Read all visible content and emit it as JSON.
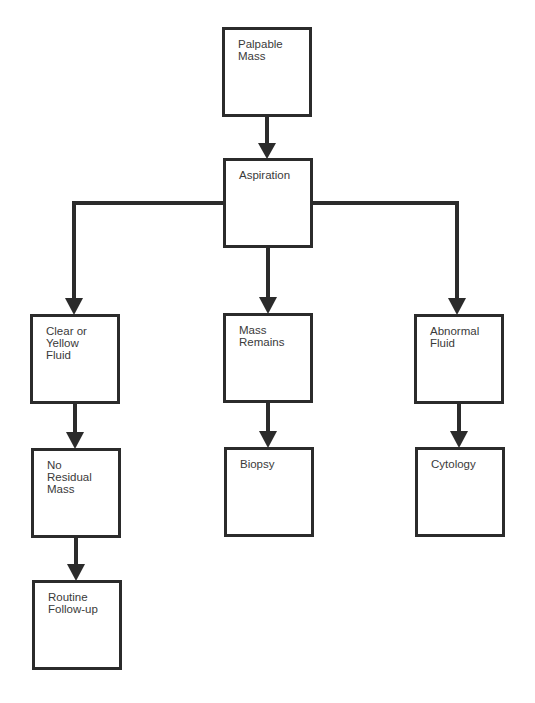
{
  "diagram": {
    "type": "flowchart",
    "colors": {
      "line": "#2b2b2b",
      "text": "#3a3a3a",
      "background": "#ffffff"
    },
    "nodes": [
      {
        "id": "palpable-mass",
        "label": "Palpable\nMass",
        "x": 222,
        "y": 27
      },
      {
        "id": "aspiration",
        "label": "Aspiration",
        "x": 223,
        "y": 158
      },
      {
        "id": "clear-yellow-fluid",
        "label": "Clear or\nYellow\nFluid",
        "x": 30,
        "y": 314
      },
      {
        "id": "mass-remains",
        "label": "Mass\nRemains",
        "x": 223,
        "y": 313
      },
      {
        "id": "abnormal-fluid",
        "label": "Abnormal\nFluid",
        "x": 414,
        "y": 314
      },
      {
        "id": "no-residual-mass",
        "label": "No\nResidual\nMass",
        "x": 31,
        "y": 448
      },
      {
        "id": "biopsy",
        "label": "Biopsy",
        "x": 224,
        "y": 447
      },
      {
        "id": "cytology",
        "label": "Cytology",
        "x": 415,
        "y": 447
      },
      {
        "id": "routine-follow-up",
        "label": "Routine\nFollow-up",
        "x": 32,
        "y": 580
      }
    ],
    "edges": [
      {
        "from": "palpable-mass",
        "to": "aspiration"
      },
      {
        "from": "aspiration",
        "to": "clear-yellow-fluid"
      },
      {
        "from": "aspiration",
        "to": "mass-remains"
      },
      {
        "from": "aspiration",
        "to": "abnormal-fluid"
      },
      {
        "from": "clear-yellow-fluid",
        "to": "no-residual-mass"
      },
      {
        "from": "mass-remains",
        "to": "biopsy"
      },
      {
        "from": "abnormal-fluid",
        "to": "cytology"
      },
      {
        "from": "no-residual-mass",
        "to": "routine-follow-up"
      }
    ]
  }
}
